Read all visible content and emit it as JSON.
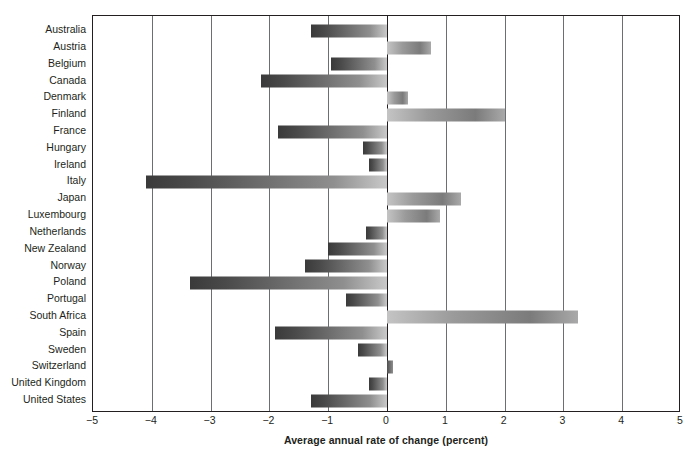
{
  "chart_data": {
    "type": "bar",
    "orientation": "horizontal",
    "title": "",
    "xlabel": "Average annual rate of change (percent)",
    "ylabel": "",
    "xlim": [
      -5,
      5
    ],
    "xticks": [
      "−5",
      "−4",
      "−3",
      "−2",
      "−1",
      "0",
      "1",
      "2",
      "3",
      "4",
      "5"
    ],
    "xtickvalues": [
      -5,
      -4,
      -3,
      -2,
      -1,
      0,
      1,
      2,
      3,
      4,
      5
    ],
    "grid": "vertical",
    "legend": "none",
    "categories": [
      "Australia",
      "Austria",
      "Belgium",
      "Canada",
      "Denmark",
      "Finland",
      "France",
      "Hungary",
      "Ireland",
      "Italy",
      "Japan",
      "Luxembourg",
      "Netherlands",
      "New Zealand",
      "Norway",
      "Poland",
      "Portugal",
      "South Africa",
      "Spain",
      "Sweden",
      "Switzerland",
      "United Kingdom",
      "United States"
    ],
    "values": [
      -1.3,
      0.75,
      -0.95,
      -2.15,
      0.35,
      2.0,
      -1.85,
      -0.4,
      -0.3,
      -4.1,
      1.25,
      0.9,
      -0.35,
      -1.0,
      -1.4,
      -3.35,
      -0.7,
      3.25,
      -1.9,
      -0.5,
      0.1,
      -0.3,
      -1.3
    ]
  },
  "axis": {
    "x_title": "Average annual rate of change (percent)"
  }
}
